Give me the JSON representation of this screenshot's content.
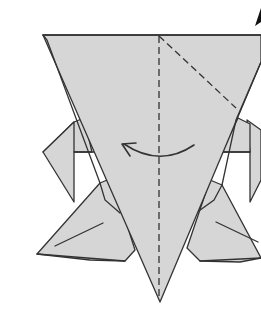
{
  "diagram": {
    "type": "origami-fold-step",
    "colors": {
      "paper": "#d6d6d6",
      "line": "#333333",
      "background": "#ffffff"
    },
    "elements": [
      "main-body-inverted-triangle",
      "left-upper-flap",
      "right-upper-flap",
      "left-lower-wing",
      "right-lower-wing",
      "center-valley-fold-line",
      "diagonal-valley-fold-line",
      "curved-fold-arrow",
      "push-arrow"
    ]
  }
}
